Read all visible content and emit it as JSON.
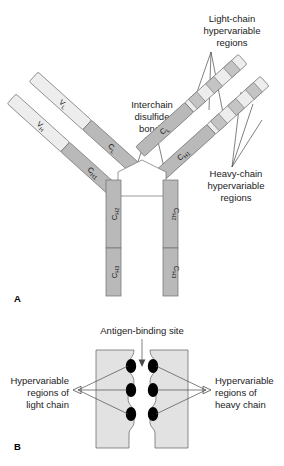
{
  "figure": {
    "panels": [
      {
        "id": "A",
        "letter": "A",
        "name": "antibody-structure-schematic",
        "annotations": [
          {
            "id": "light-chain-hypervariable",
            "lines": [
              "Light-chain",
              "hypervariable",
              "regions"
            ]
          },
          {
            "id": "interchain-disulfide",
            "lines": [
              "Interchain",
              "disulfide",
              "bonds"
            ]
          },
          {
            "id": "heavy-chain-hypervariable",
            "lines": [
              "Heavy-chain",
              "hypervariable",
              "regions"
            ]
          }
        ],
        "domains": [
          {
            "id": "vl-left",
            "base": "V",
            "sub": "L"
          },
          {
            "id": "vh-left",
            "base": "V",
            "sub": "H"
          },
          {
            "id": "cl-left",
            "base": "C",
            "sub": "L"
          },
          {
            "id": "ch1-left",
            "base": "C",
            "sub": "H1"
          },
          {
            "id": "cl-right",
            "base": "C",
            "sub": "L"
          },
          {
            "id": "ch1-right",
            "base": "C",
            "sub": "H1"
          },
          {
            "id": "ch2-left",
            "base": "C",
            "sub": "H2"
          },
          {
            "id": "ch3-left",
            "base": "C",
            "sub": "H3"
          },
          {
            "id": "ch2-right",
            "base": "C",
            "sub": "H2"
          },
          {
            "id": "ch3-right",
            "base": "C",
            "sub": "H3"
          }
        ]
      },
      {
        "id": "B",
        "letter": "B",
        "name": "antigen-binding-site-detail",
        "annotations": [
          {
            "id": "antigen-binding-site",
            "lines": [
              "Antigen-binding site"
            ]
          },
          {
            "id": "hypervariable-light",
            "lines": [
              "Hypervariable",
              "regions of",
              "light chain"
            ]
          },
          {
            "id": "hypervariable-heavy",
            "lines": [
              "Hypervariable",
              "regions of",
              "heavy chain"
            ]
          }
        ],
        "hypervariable_spot_count_per_side": 3
      }
    ]
  },
  "colors": {
    "chain_light": "#ededed",
    "chain_mid": "#d9d9d9",
    "chain_dark": "#b9b9b9",
    "hypervariable_band": "#c4c4c4",
    "spot_fill": "#000000",
    "outline": "#6e6e6e",
    "leader": "#4a4a4a",
    "text": "#1a1a1a",
    "background": "#ffffff"
  }
}
